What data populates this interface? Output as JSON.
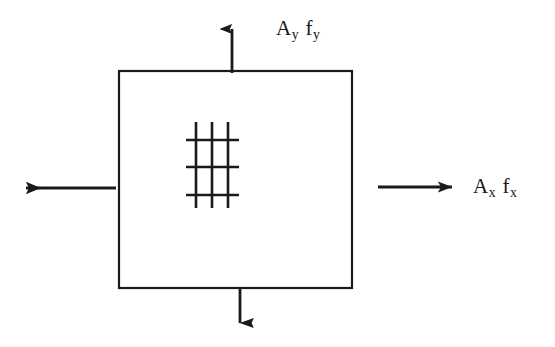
{
  "figure": {
    "background_color": "#ffffff",
    "stroke_color": "#1a1a1a",
    "width": 555,
    "height": 347
  },
  "labels": {
    "top": {
      "full_text": "Ay fy",
      "term1_base": "A",
      "term1_sub": "y",
      "term2_base": "f",
      "term2_sub": "y"
    },
    "right": {
      "full_text": "Ax fx",
      "term1_base": "A",
      "term1_sub": "x",
      "term2_base": "f",
      "term2_sub": "x"
    }
  },
  "diagram_data": {
    "type": "diagram",
    "element_box": {
      "name": "material-element-square",
      "x": 119,
      "y": 71,
      "width": 233,
      "height": 217,
      "stroke_width": 2.2
    },
    "inner_mesh": {
      "name": "fiber-mesh-hatch",
      "vertical_lines_x": [
        196,
        212,
        228
      ],
      "vertical_span_y": [
        122,
        208
      ],
      "horizontal_lines_y": [
        140,
        167,
        195
      ],
      "horizontal_span_x": [
        186,
        239
      ],
      "stroke_width": 2.6
    },
    "arrows": [
      {
        "name": "arrow-up",
        "direction": "up",
        "x1": 232,
        "y1": 73,
        "x2": 232,
        "y2": 16,
        "label_ref": "labels.top"
      },
      {
        "name": "arrow-down",
        "direction": "down",
        "x1": 240,
        "y1": 289,
        "x2": 240,
        "y2": 338,
        "label_ref": null
      },
      {
        "name": "arrow-left",
        "direction": "left",
        "x1": 116,
        "y1": 188,
        "x2": 11,
        "y2": 188,
        "label_ref": null
      },
      {
        "name": "arrow-right",
        "direction": "right",
        "x1": 378,
        "y1": 187,
        "x2": 467,
        "y2": 187,
        "label_ref": "labels.right"
      }
    ]
  }
}
